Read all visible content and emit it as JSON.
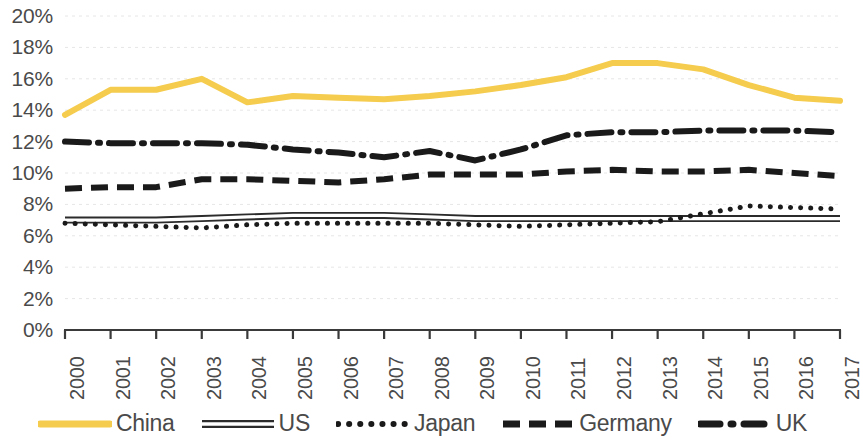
{
  "chart_data": {
    "type": "line",
    "title": "",
    "subtitle": "",
    "xlabel": "",
    "ylabel": "",
    "grid": true,
    "legend_position": "bottom",
    "x": [
      "2000",
      "2001",
      "2002",
      "2003",
      "2004",
      "2005",
      "2006",
      "2007",
      "2008",
      "2009",
      "2010",
      "2011",
      "2012",
      "2013",
      "2014",
      "2015",
      "2016",
      "2017"
    ],
    "xlim": [
      2000,
      2017
    ],
    "ylim": [
      0,
      20
    ],
    "yticks": [
      "0%",
      "2%",
      "4%",
      "6%",
      "8%",
      "10%",
      "12%",
      "14%",
      "16%",
      "18%",
      "20%"
    ],
    "ytick_values": [
      0,
      2,
      4,
      6,
      8,
      10,
      12,
      14,
      16,
      18,
      20
    ],
    "y_unit": "%",
    "series": [
      {
        "name": "China",
        "color": "#f5cc4d",
        "style": "solid",
        "width": 6,
        "values": [
          13.7,
          15.3,
          15.3,
          16.0,
          14.5,
          14.9,
          14.8,
          14.7,
          14.9,
          15.2,
          15.6,
          16.1,
          17.0,
          17.0,
          16.6,
          15.6,
          14.8,
          14.6
        ]
      },
      {
        "name": "US",
        "color": "#2b2b2b",
        "style": "double-solid",
        "width": 2,
        "values": [
          7.0,
          7.0,
          7.0,
          7.1,
          7.2,
          7.3,
          7.3,
          7.3,
          7.2,
          7.1,
          7.1,
          7.1,
          7.1,
          7.1,
          7.1,
          7.1,
          7.1,
          7.1
        ]
      },
      {
        "name": "Japan",
        "color": "#1a1a1a",
        "style": "dotted",
        "width": 5,
        "values": [
          6.8,
          6.7,
          6.6,
          6.5,
          6.7,
          6.8,
          6.8,
          6.8,
          6.8,
          6.7,
          6.6,
          6.7,
          6.8,
          6.9,
          7.4,
          7.9,
          7.8,
          7.7
        ]
      },
      {
        "name": "Germany",
        "color": "#1a1a1a",
        "style": "dashed",
        "width": 6,
        "values": [
          9.0,
          9.1,
          9.1,
          9.6,
          9.6,
          9.5,
          9.4,
          9.6,
          9.9,
          9.9,
          9.9,
          10.1,
          10.2,
          10.1,
          10.1,
          10.2,
          10.0,
          9.8
        ]
      },
      {
        "name": "UK",
        "color": "#1a1a1a",
        "style": "dash-dot",
        "width": 6,
        "values": [
          12.0,
          11.9,
          11.9,
          11.9,
          11.8,
          11.5,
          11.3,
          11.0,
          11.4,
          10.8,
          11.5,
          12.4,
          12.6,
          12.6,
          12.7,
          12.7,
          12.7,
          12.6
        ]
      }
    ]
  },
  "axis": {
    "y_labels": [
      "20%",
      "18%",
      "16%",
      "14%",
      "12%",
      "10%",
      "8%",
      "6%",
      "4%",
      "2%",
      "0%"
    ],
    "x_labels": [
      "2000",
      "2001",
      "2002",
      "2003",
      "2004",
      "2005",
      "2006",
      "2007",
      "2008",
      "2009",
      "2010",
      "2011",
      "2012",
      "2013",
      "2014",
      "2015",
      "2016",
      "2017"
    ]
  },
  "legend": {
    "items": [
      {
        "label": "China",
        "key": "china-line-swatch"
      },
      {
        "label": "US",
        "key": "us-line-swatch"
      },
      {
        "label": "Japan",
        "key": "japan-line-swatch"
      },
      {
        "label": "Germany",
        "key": "germany-line-swatch"
      },
      {
        "label": "UK",
        "key": "uk-line-swatch"
      }
    ]
  },
  "colors": {
    "china": "#f5cc4d",
    "series_black": "#1a1a1a",
    "text": "#4a4a4a",
    "gridline": "#e6e6e6",
    "axis": "#3a3a3a",
    "background": "#ffffff"
  }
}
